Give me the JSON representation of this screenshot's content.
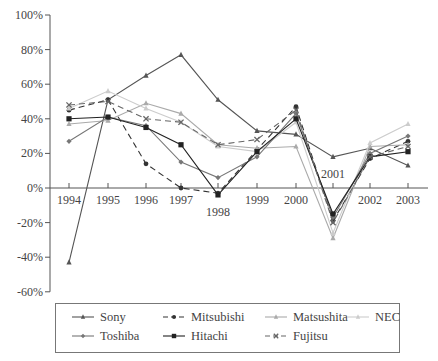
{
  "chart_data": {
    "type": "line",
    "title": "",
    "xlabel": "",
    "ylabel": "",
    "ylim": [
      -60,
      100
    ],
    "y_ticks": [
      "100%",
      "80%",
      "60%",
      "40%",
      "20%",
      "0%",
      "-20%",
      "-40%",
      "-60%"
    ],
    "y_tick_values": [
      100,
      80,
      60,
      40,
      20,
      0,
      -20,
      -40,
      -60
    ],
    "categories": [
      "1994",
      "1995",
      "1996",
      "1997",
      "1998",
      "1999",
      "2000",
      "2001",
      "2002",
      "2003"
    ],
    "label_below_axis": [
      "1998"
    ],
    "label_above_axis": [
      "2001"
    ],
    "grid": false,
    "legend_position": "bottom",
    "series": [
      {
        "name": "Sony",
        "marker": "triangle",
        "dash": "solid",
        "color": "#555555",
        "values": [
          -43,
          51,
          65,
          77,
          51,
          33,
          31,
          18,
          23,
          13
        ]
      },
      {
        "name": "Mitsubishi",
        "marker": "circle",
        "dash": "dashed",
        "color": "#333333",
        "values": [
          45,
          51,
          14,
          0,
          -3,
          22,
          47,
          -19,
          17,
          27
        ]
      },
      {
        "name": "Matsushita",
        "marker": "triangle",
        "dash": "solid",
        "color": "#aaaaaa",
        "values": [
          37,
          39,
          49,
          43,
          25,
          23,
          24,
          -29,
          24,
          25
        ]
      },
      {
        "name": "NEC",
        "marker": "triangle",
        "dash": "solid",
        "color": "#cccccc",
        "values": [
          46,
          56,
          46,
          38,
          24,
          21,
          38,
          -26,
          26,
          37
        ]
      },
      {
        "name": "Toshiba",
        "marker": "diamond",
        "dash": "solid",
        "color": "#777777",
        "values": [
          27,
          41,
          36,
          15,
          6,
          18,
          43,
          -17,
          20,
          30
        ]
      },
      {
        "name": "Hitachi",
        "marker": "square",
        "dash": "solid",
        "color": "#222222",
        "values": [
          40,
          41,
          35,
          25,
          -4,
          21,
          40,
          -15,
          18,
          21
        ]
      },
      {
        "name": "Fujitsu",
        "marker": "x",
        "dash": "dashed",
        "color": "#666666",
        "values": [
          48,
          50,
          40,
          38,
          25,
          28,
          45,
          -20,
          18,
          24
        ]
      }
    ]
  },
  "legend": {
    "items": [
      "Sony",
      "Mitsubishi",
      "Matsushita",
      "NEC",
      "Toshiba",
      "Hitachi",
      "Fujitsu"
    ]
  }
}
